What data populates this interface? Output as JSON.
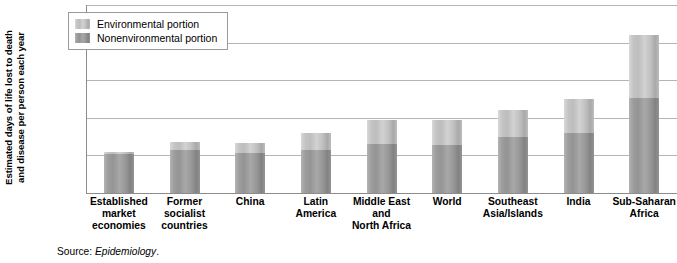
{
  "chart_data": {
    "type": "bar",
    "title": "",
    "subtitle": "",
    "stacked": true,
    "xlabel": "",
    "ylabel": "Estimated days of life lost to death and disease per person each year",
    "ylabel_lines": [
      "Estimated days of life lost to death",
      "and disease per person each year"
    ],
    "ylim": [
      0,
      250
    ],
    "yticks": [
      0,
      50,
      100,
      150,
      200,
      250
    ],
    "ytick_labels": [
      "0",
      "50",
      "100",
      "150",
      "200",
      "250"
    ],
    "grid": "horizontal",
    "legend_position": "top-left",
    "categories": [
      "Established market economies",
      "Former socialist countries",
      "China",
      "Latin America",
      "Middle East and North Africa",
      "World",
      "Southeast Asia/Islands",
      "India",
      "Sub-Saharan Africa"
    ],
    "category_label_lines": [
      [
        "Established",
        "market",
        "economies"
      ],
      [
        "Former",
        "socialist",
        "countries"
      ],
      [
        "China"
      ],
      [
        "Latin",
        "America"
      ],
      [
        "Middle East",
        "and",
        "North Africa"
      ],
      [
        "World"
      ],
      [
        "Southeast",
        "Asia/Islands"
      ],
      [
        "India"
      ],
      [
        "Sub-Saharan",
        "Africa"
      ]
    ],
    "series": [
      {
        "name": "Nonenvironmental portion",
        "color": "#949494",
        "values": [
          52,
          57,
          53,
          57,
          65,
          64,
          75,
          80,
          127
        ]
      },
      {
        "name": "Environmental portion",
        "color": "#c0c0c0",
        "values": [
          3,
          11,
          14,
          23,
          32,
          33,
          36,
          45,
          83
        ]
      }
    ],
    "totals": [
      55,
      68,
      67,
      80,
      97,
      97,
      111,
      125,
      210
    ],
    "annotations": []
  },
  "legend": {
    "items": [
      {
        "label": "Environmental portion",
        "swatch": "environmental-swatch"
      },
      {
        "label": "Nonenvironmental portion",
        "swatch": "nonenvironmental-swatch"
      }
    ]
  },
  "source": {
    "prefix": "Source: ",
    "publication": "Epidemiology",
    "suffix": "."
  }
}
